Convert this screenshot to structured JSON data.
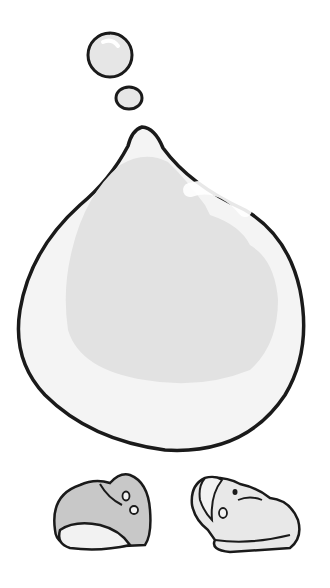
{
  "illustration": {
    "subject": "water drop with bubbles and two shoe-like shapes",
    "colors": {
      "background": "#ffffff",
      "outline": "#1a1a1a",
      "drop_fill": "#f4f4f4",
      "drop_shade": "#e2e2e2",
      "bubble_fill": "#e6e6e6",
      "left_shape_fill": "#c8c8c8",
      "right_shape_fill": "#e8e8e8",
      "light_fill": "#f2f2f2"
    }
  }
}
